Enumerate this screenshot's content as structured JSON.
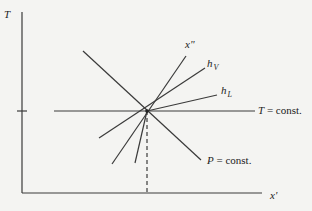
{
  "diagram": {
    "axes": {
      "y_label": "T",
      "x_label": "x'"
    },
    "lines": {
      "x_double_prime": "x\"",
      "h_v": "h",
      "h_v_sub": "V",
      "h_l": "h",
      "h_l_sub": "L",
      "t_const": "T = const.",
      "p_const": "P = const."
    },
    "t_const_var": "T",
    "t_const_rest": " = const.",
    "p_const_var": "P",
    "p_const_rest": " = const."
  }
}
